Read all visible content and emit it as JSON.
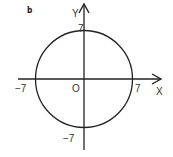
{
  "panel_label": "b",
  "axes": {
    "x_label": "X",
    "y_label": "Y",
    "origin_label": "O"
  },
  "ticks": {
    "x_neg": "−7",
    "x_pos": "7",
    "y_pos": "7",
    "y_neg": "−7"
  },
  "circle": {
    "equation": "x^2 + y^2 = 49",
    "center": [
      0,
      0
    ],
    "radius": 7
  },
  "colors": {
    "stroke": "#222222",
    "text": "#333333"
  }
}
